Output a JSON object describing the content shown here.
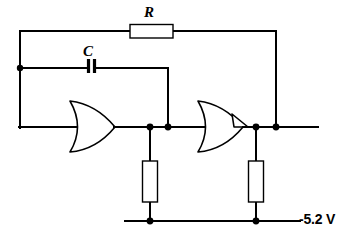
{
  "figure": {
    "width": 344,
    "height": 240,
    "background_color": "#ffffff",
    "line_color": "#000000"
  },
  "labels": {
    "resistor_r": "R",
    "capacitor_c": "C",
    "supply_voltage": "-5.2 V"
  },
  "components": [
    {
      "id": "resistor-r",
      "type": "resistor",
      "label": "R",
      "orientation": "horizontal",
      "x": 130,
      "y": 25,
      "width": 43,
      "height": 13
    },
    {
      "id": "capacitor-c",
      "type": "capacitor",
      "label": "C",
      "orientation": "horizontal",
      "x": 87,
      "y": 59,
      "width": 9,
      "height": 14
    },
    {
      "id": "or-gate-left",
      "type": "or-gate",
      "label": "",
      "x": 70,
      "y": 100,
      "width": 45,
      "height": 52
    },
    {
      "id": "or-gate-right",
      "type": "or-gate",
      "label": "",
      "x": 198,
      "y": 100,
      "width": 47,
      "height": 52
    },
    {
      "id": "resistor-pulldown-left",
      "type": "resistor",
      "label": "",
      "orientation": "vertical",
      "x": 143,
      "y": 161,
      "width": 15,
      "height": 41
    },
    {
      "id": "resistor-pulldown-right",
      "type": "resistor",
      "label": "",
      "orientation": "vertical",
      "x": 249,
      "y": 161,
      "width": 15,
      "height": 41
    }
  ],
  "nets": [
    {
      "id": "feedback-top-rail",
      "description": "Top feedback path through R from left node to right output node",
      "points": "20,127 20,31 130,31 173,31 276,31 276,127"
    },
    {
      "id": "capacitor-rail",
      "description": "Capacitor branch from left node to first gate output node",
      "points": "20,68 87,68 96,68 168,68 168,127"
    },
    {
      "id": "output-rail",
      "description": "Main horizontal output rail",
      "points": "20,127 318,127"
    },
    {
      "id": "supply-rail",
      "description": "Negative supply rail",
      "points": "125,221 300,221"
    },
    {
      "id": "pulldown-left-net",
      "description": "Left pull-down resistor leg",
      "points": "150,127 150,221"
    },
    {
      "id": "pulldown-right-net",
      "description": "Right pull-down resistor leg",
      "points": "256,127 256,221"
    }
  ],
  "junctions": [
    {
      "id": "node-left-cap",
      "x": 20,
      "y": 68
    },
    {
      "id": "node-gate1-out",
      "x": 150,
      "y": 127
    },
    {
      "id": "node-cap-return",
      "x": 168,
      "y": 127
    },
    {
      "id": "node-gate2-out",
      "x": 256,
      "y": 127
    },
    {
      "id": "node-feedback-return",
      "x": 276,
      "y": 127
    },
    {
      "id": "node-supply-left",
      "x": 150,
      "y": 221
    },
    {
      "id": "node-supply-right",
      "x": 256,
      "y": 221
    }
  ]
}
